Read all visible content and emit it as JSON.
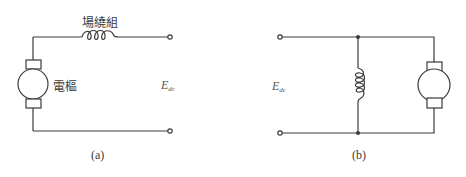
{
  "figure": {
    "colors": {
      "line": "#3a3a3a",
      "background": "#ffffff"
    },
    "panel_a": {
      "field_winding_label": "場繞組",
      "armature_label": "電樞",
      "voltage_symbol": "E",
      "voltage_subscript": "dc",
      "caption": "(a)"
    },
    "panel_b": {
      "voltage_symbol": "E",
      "voltage_subscript": "dc",
      "caption": "(b)"
    }
  }
}
